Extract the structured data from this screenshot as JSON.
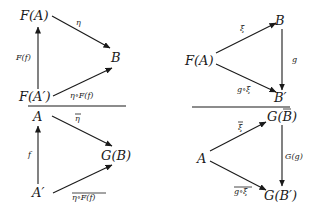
{
  "diagrams": {
    "top_left": {
      "nodes": {
        "FA": "F(A)",
        "B": "B",
        "FAp": "F(A′)"
      },
      "labels": {
        "eta": "η",
        "Ff": "F(f)",
        "eta_Ff": "η∘F(f)"
      }
    },
    "bottom_left": {
      "nodes": {
        "A": "A",
        "GB": "G(B)",
        "Ap": "A′"
      },
      "labels": {
        "eta_bar": "η",
        "f": "f",
        "eta_Ff_bar": "η∘F(f)"
      },
      "overlined": [
        "eta_bar",
        "eta_Ff_bar"
      ]
    },
    "top_right": {
      "nodes": {
        "FA": "F(A)",
        "B": "B",
        "Bp": "B′"
      },
      "labels": {
        "xi": "ξ",
        "g": "g",
        "g_xi": "g∘ξ"
      }
    },
    "bottom_right": {
      "nodes": {
        "A": "A",
        "GB": "G(B)",
        "GBp": "G(B′)"
      },
      "labels": {
        "xi_bar": "ξ",
        "Gg": "G(g)",
        "g_xi_bar": "g∘ξ"
      },
      "overlined": [
        "xi_bar",
        "g_xi_bar",
        "GB_bar"
      ]
    }
  }
}
